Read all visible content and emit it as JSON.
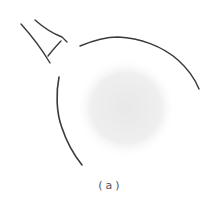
{
  "figure": {
    "caption": "(a)",
    "top_partial_text": "",
    "colors": {
      "stroke": "#3a3a3a",
      "shading": "#ececec",
      "caption": "#555555"
    }
  }
}
